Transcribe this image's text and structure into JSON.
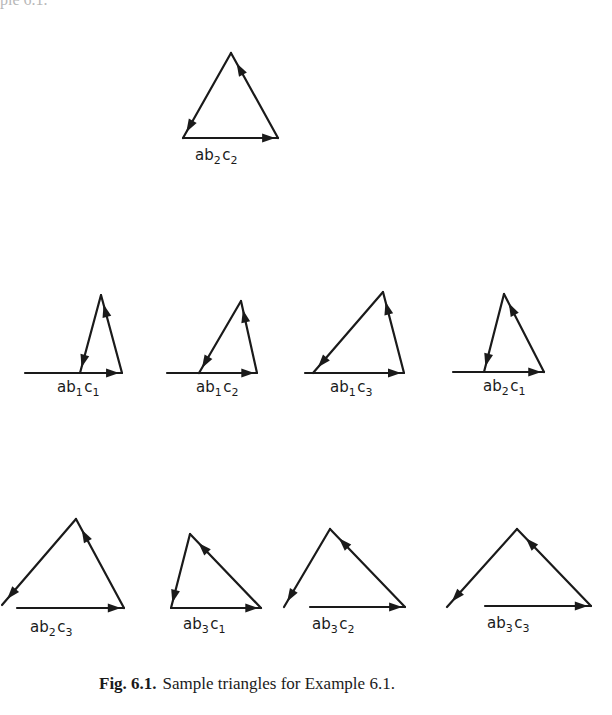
{
  "page": {
    "top_fragment": "ple 6.1."
  },
  "figure": {
    "stroke_color": "#1a1a1a",
    "triangles": [
      {
        "id": "ab2c2",
        "label": {
          "parts": [
            [
              "a",
              ""
            ],
            [
              "b",
              "2"
            ],
            [
              "c",
              "2"
            ]
          ],
          "x": 195,
          "y": 160
        },
        "base": {
          "x1": 183,
          "y1": 138,
          "x2": 278,
          "y2": 138
        },
        "apex": {
          "x": 231,
          "y": 53
        },
        "left_end": {
          "x": 183,
          "y": 138
        }
      },
      {
        "id": "ab1c1",
        "label": {
          "parts": [
            [
              "a",
              ""
            ],
            [
              "b",
              "1"
            ],
            [
              "c",
              "1"
            ]
          ],
          "x": 57,
          "y": 392
        },
        "base": {
          "x1": 25,
          "y1": 373,
          "x2": 122,
          "y2": 373
        },
        "apex": {
          "x": 101,
          "y": 295
        },
        "left_end": {
          "x": 80,
          "y": 373
        }
      },
      {
        "id": "ab1c2",
        "label": {
          "parts": [
            [
              "a",
              ""
            ],
            [
              "b",
              "1"
            ],
            [
              "c",
              "2"
            ]
          ],
          "x": 196,
          "y": 392
        },
        "base": {
          "x1": 167,
          "y1": 373,
          "x2": 257,
          "y2": 373
        },
        "apex": {
          "x": 241,
          "y": 301
        },
        "left_end": {
          "x": 199,
          "y": 373
        }
      },
      {
        "id": "ab1c3",
        "label": {
          "parts": [
            [
              "a",
              ""
            ],
            [
              "b",
              "1"
            ],
            [
              "c",
              "3"
            ]
          ],
          "x": 330,
          "y": 392
        },
        "base": {
          "x1": 305,
          "y1": 373,
          "x2": 404,
          "y2": 373
        },
        "apex": {
          "x": 383,
          "y": 292
        },
        "left_end": {
          "x": 313,
          "y": 373
        }
      },
      {
        "id": "ab2c1",
        "label": {
          "parts": [
            [
              "a",
              ""
            ],
            [
              "b",
              "2"
            ],
            [
              "c",
              "1"
            ]
          ],
          "x": 483,
          "y": 391
        },
        "base": {
          "x1": 453,
          "y1": 372,
          "x2": 544,
          "y2": 372
        },
        "apex": {
          "x": 504,
          "y": 294
        },
        "left_end": {
          "x": 484,
          "y": 372
        }
      },
      {
        "id": "ab2c3",
        "label": {
          "parts": [
            [
              "a",
              ""
            ],
            [
              "b",
              "2"
            ],
            [
              "c",
              "3"
            ]
          ],
          "x": 30,
          "y": 632
        },
        "base": {
          "x1": 17,
          "y1": 608,
          "x2": 124,
          "y2": 608
        },
        "apex": {
          "x": 76,
          "y": 519
        },
        "left_end": {
          "x": 2,
          "y": 605
        }
      },
      {
        "id": "ab3c1",
        "label": {
          "parts": [
            [
              "a",
              ""
            ],
            [
              "b",
              "3"
            ],
            [
              "c",
              "1"
            ]
          ],
          "x": 183,
          "y": 629
        },
        "base": {
          "x1": 171,
          "y1": 608,
          "x2": 261,
          "y2": 608
        },
        "apex": {
          "x": 190,
          "y": 534
        },
        "left_end": {
          "x": 171,
          "y": 608
        }
      },
      {
        "id": "ab3c2",
        "label": {
          "parts": [
            [
              "a",
              ""
            ],
            [
              "b",
              "3"
            ],
            [
              "c",
              "2"
            ]
          ],
          "x": 312,
          "y": 629
        },
        "base": {
          "x1": 310,
          "y1": 607,
          "x2": 405,
          "y2": 607
        },
        "apex": {
          "x": 330,
          "y": 529
        },
        "left_end": {
          "x": 284,
          "y": 607
        }
      },
      {
        "id": "ab3c3",
        "label": {
          "parts": [
            [
              "a",
              ""
            ],
            [
              "b",
              "3"
            ],
            [
              "c",
              "3"
            ]
          ],
          "x": 487,
          "y": 628
        },
        "base": {
          "x1": 485,
          "y1": 606,
          "x2": 591,
          "y2": 606
        },
        "apex": {
          "x": 517,
          "y": 529
        },
        "left_end": {
          "x": 447,
          "y": 607
        }
      }
    ]
  },
  "caption": {
    "fig_number": "Fig. 6.1.",
    "text": "Sample triangles for Example 6.1."
  }
}
